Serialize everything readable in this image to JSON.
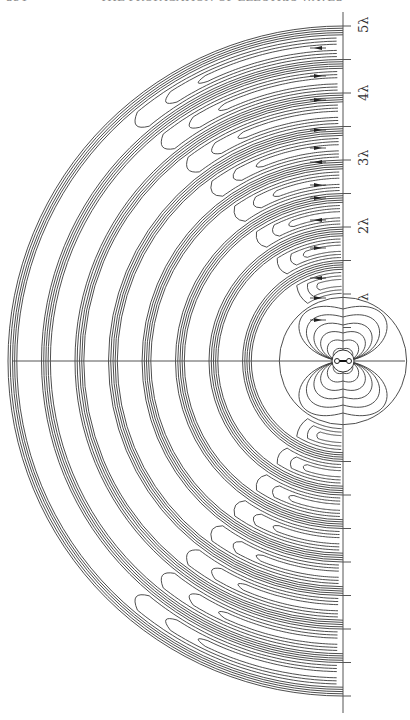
{
  "header": {
    "page_number": "354",
    "running_title": "THE PROPAGATION OF ELECTRIC WAVES",
    "right_mark": "[",
    "note": "header text cropped at top edge"
  },
  "figure": {
    "center": {
      "x": 343,
      "y": 361
    },
    "wavelength_px": 67,
    "axis_labels": [
      {
        "text": "λ",
        "distance": 1,
        "y": 293
      },
      {
        "text": "2λ",
        "distance": 2,
        "y": 226
      },
      {
        "text": "3λ",
        "distance": 3,
        "y": 158
      },
      {
        "text": "4λ",
        "distance": 4,
        "y": 93
      },
      {
        "text": "5λ",
        "distance": 5,
        "y": 25
      }
    ],
    "line_color": "#3a3a3a",
    "dipole": {
      "label": "oscillator",
      "symbol": "o—o"
    }
  }
}
